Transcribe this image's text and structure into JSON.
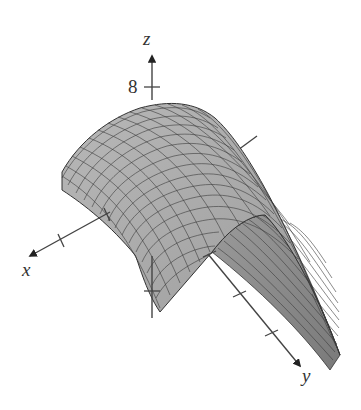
{
  "figure": {
    "type": "3d-surface-plot",
    "axes": {
      "x": {
        "label": "x",
        "ticks": 2
      },
      "y": {
        "label": "y",
        "ticks": 4
      },
      "z": {
        "label": "z",
        "tick_labels": [
          "8"
        ]
      }
    },
    "colors": {
      "surface_fill": "#a9a9a9",
      "surface_fill_shadow": "#8c8c8c",
      "mesh_lines": "#3a3a3a",
      "axis": "#444444",
      "background": "#ffffff"
    }
  }
}
